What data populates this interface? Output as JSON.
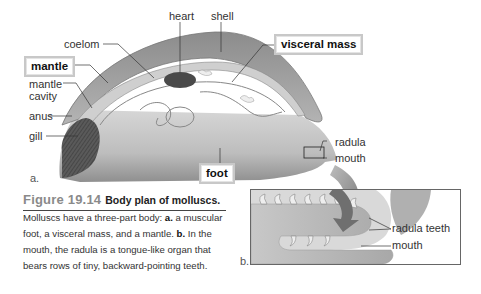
{
  "figure": {
    "number": "Figure 19.14",
    "title": "Body plan of molluscs.",
    "caption": {
      "intro": "Molluscs have a three-part body: ",
      "a_marker": "a.",
      "a_text": " a muscular foot, a visceral mass, and a mantle. ",
      "b_marker": "b.",
      "b_text": " In the mouth, the radula is a tongue-like organ that bears rows of tiny, backward-pointing teeth."
    }
  },
  "panel_a": {
    "label": "a.",
    "labels": {
      "heart": "heart",
      "shell": "shell",
      "coelom": "coelom",
      "visceral_mass": "visceral mass",
      "mantle": "mantle",
      "mantle_cavity_line1": "mantle",
      "mantle_cavity_line2": "cavity",
      "anus": "anus",
      "gill": "gill",
      "radula": "radula",
      "mouth": "mouth",
      "foot": "foot"
    }
  },
  "panel_b": {
    "label": "b.",
    "labels": {
      "radula_teeth": "radula teeth",
      "mouth": "mouth"
    }
  },
  "colors": {
    "figure_number": "#8a8a8a",
    "body_gray": "#b9b9b9",
    "shell_gray": "#9a9a9a",
    "border": "#666666"
  }
}
